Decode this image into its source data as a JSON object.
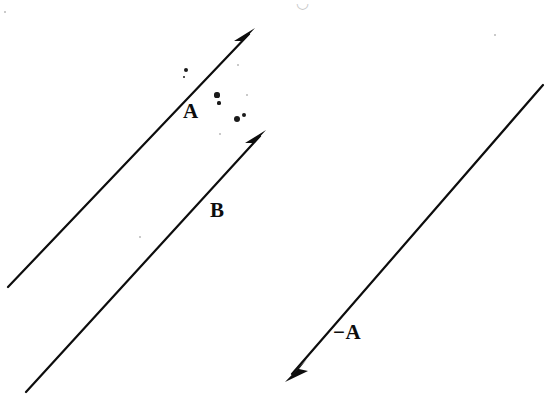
{
  "figure": {
    "width": 557,
    "height": 404,
    "background_color": "#ffffff",
    "ink_color": "#0d0d0d",
    "line_width": 2.2
  },
  "labels": {
    "a": "A",
    "b": "B",
    "neg_a": "−A",
    "top_artifact": "◡"
  },
  "chart_data": {
    "type": "scatter",
    "xlabel": "",
    "ylabel": "",
    "xlim": [
      0,
      557
    ],
    "ylim": [
      404,
      0
    ],
    "grid": false,
    "legend": "none",
    "annotations": [
      "A",
      "B",
      "−A"
    ],
    "series": [
      {
        "name": "A",
        "label": "A",
        "kind": "arrow",
        "tail": [
          8,
          287
        ],
        "head": [
          255,
          28
        ],
        "dx": 247,
        "dy": -259,
        "length": 357.9,
        "angle_deg": 46.4,
        "label_position": [
          192,
          113
        ],
        "color": "#0d0d0d"
      },
      {
        "name": "B",
        "label": "B",
        "kind": "arrow",
        "tail": [
          26,
          392
        ],
        "head": [
          266,
          130
        ],
        "dx": 240,
        "dy": -262,
        "length": 355.4,
        "angle_deg": 47.5,
        "label_position": [
          219,
          211
        ],
        "color": "#0d0d0d"
      },
      {
        "name": "-A",
        "label": "−A",
        "kind": "arrow",
        "tail": [
          543,
          85
        ],
        "head": [
          285,
          382
        ],
        "dx": -258,
        "dy": 297,
        "length": 393.4,
        "angle_deg": -131.0,
        "label_position": [
          350,
          333
        ],
        "color": "#0d0d0d"
      }
    ],
    "scan_specks": [
      {
        "x": 186,
        "y": 70,
        "r": 2.2,
        "tone": "dark"
      },
      {
        "x": 184,
        "y": 77,
        "r": 1.4,
        "tone": "dark"
      },
      {
        "x": 217,
        "y": 95,
        "r": 2.6,
        "tone": "dark"
      },
      {
        "x": 219,
        "y": 103,
        "r": 1.6,
        "tone": "dark"
      },
      {
        "x": 237,
        "y": 119,
        "r": 3.4,
        "tone": "dark"
      },
      {
        "x": 244,
        "y": 115,
        "r": 2.0,
        "tone": "dark"
      },
      {
        "x": 238,
        "y": 65,
        "r": 1.2,
        "tone": "faint"
      },
      {
        "x": 247,
        "y": 95,
        "r": 1.0,
        "tone": "faint"
      },
      {
        "x": 220,
        "y": 134,
        "r": 1.4,
        "tone": "faint"
      },
      {
        "x": 140,
        "y": 237,
        "r": 1.4,
        "tone": "faint"
      },
      {
        "x": 5,
        "y": 12,
        "r": 1.2,
        "tone": "faint"
      },
      {
        "x": 495,
        "y": 35,
        "r": 1.4,
        "tone": "faint"
      }
    ]
  }
}
